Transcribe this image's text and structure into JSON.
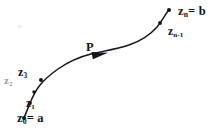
{
  "figure": {
    "style": "hand-drawn scanned line figure",
    "background_color": "#fefefe",
    "ink_color": "#15161a",
    "faint_ink_color": "#9a9ca2",
    "width": 216,
    "height": 130
  },
  "labels": {
    "endpoint_end": "zₙ = b",
    "endpoint_end_symbol": "z",
    "endpoint_end_sub": "n",
    "endpoint_end_value": "= b",
    "near_end": "z",
    "near_end_sub": "n-1",
    "curve_name": "P",
    "point_3": "z",
    "point_3_sub": "3",
    "point_2": "z",
    "point_2_sub": "2",
    "point_1": "z",
    "point_1_sub": "1",
    "endpoint_start": "z",
    "endpoint_start_sub": "0",
    "endpoint_start_value": "= a"
  },
  "curve": {
    "type": "open oriented arc",
    "direction": "from lower-left to upper-right",
    "arrow_position_fraction": 0.45,
    "arrow_label": "P",
    "path_d": "M 24 118 L 27 110 L 30 103 C 33 96 36 90 40 85 C 45 79 51 74 58 69 C 68 62 79 57 91 54 C 104 51 117 49 129 45 C 141 41 150 35 157 27 C 162 21 165 15 168 11",
    "segment_start_d": "M 24 118 L 30 103",
    "segment_main_d": "M 30 103 C 33 96 36 90 40 85 C 45 79 51 74 58 69 C 68 62 79 57 91 54 C 104 51 117 49 129 45 C 141 41 150 35 157 27 C 162 21 165 15 168 11"
  },
  "markers": [
    {
      "name": "z0",
      "x": 24,
      "y": 118,
      "kind": "dot"
    },
    {
      "name": "z1",
      "x": 30,
      "y": 103,
      "kind": "dot"
    },
    {
      "name": "z2",
      "x": 34,
      "y": 92,
      "kind": "dot"
    },
    {
      "name": "z3",
      "x": 41,
      "y": 80,
      "kind": "dot"
    },
    {
      "name": "zn-1",
      "x": 160,
      "y": 23,
      "kind": "dot"
    },
    {
      "name": "zn",
      "x": 169,
      "y": 10,
      "kind": "dot"
    }
  ],
  "arrowhead": {
    "x": 100,
    "y": 54,
    "angle_deg": -11,
    "length": 16,
    "width": 7
  }
}
